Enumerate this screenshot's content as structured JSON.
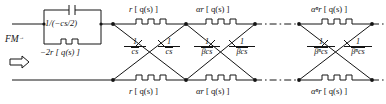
{
  "diagram": {
    "type": "circuit-schematic",
    "colors": {
      "line": "#141414",
      "text": "#141414",
      "background": "#ffffff"
    },
    "input": {
      "label": "FM",
      "subscript": "→",
      "arrow_icon": "hollow-right-arrow"
    },
    "source_block": {
      "capacitor_label": "1/(−cs/2)",
      "resistor_label": "−2r [ q(s) ]"
    },
    "top_rail": {
      "series_elements": [
        {
          "label_main": "r",
          "label_arg": "[ q(s) ]"
        },
        {
          "label_main": "αr",
          "label_arg": "[ q(s) ]"
        },
        {
          "label_main": "αⁿr",
          "label_arg": "[ q(s) ]"
        }
      ]
    },
    "bottom_rail": {
      "series_elements": [
        {
          "label_main": "r",
          "label_arg": "[ q(s) ]"
        },
        {
          "label_main": "αr",
          "label_arg": "[ q(s) ]"
        },
        {
          "label_main": "αⁿr",
          "label_arg": "[ q(s) ]"
        }
      ]
    },
    "lattice_branches": [
      {
        "numerator": "1",
        "denominator": "cs",
        "overline_on": "c"
      },
      {
        "numerator": "1",
        "denominator": "cs",
        "overline_on": "c"
      },
      {
        "numerator": "1",
        "denominator": "βcs",
        "overline_on": "β"
      },
      {
        "numerator": "1",
        "denominator": "βcs",
        "overline_on": "β"
      },
      {
        "numerator": "1",
        "denominator": "βⁿcs",
        "overline_on": "βⁿ"
      },
      {
        "numerator": "1",
        "denominator": "βⁿcs",
        "overline_on": "βⁿ"
      }
    ],
    "continuation": "dash-dot-line"
  }
}
